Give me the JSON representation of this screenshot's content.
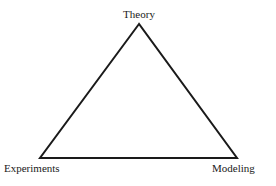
{
  "diagram": {
    "type": "triangle",
    "nodes": [
      {
        "id": "theory",
        "label": "Theory",
        "position": "top"
      },
      {
        "id": "experiments",
        "label": "Experiments",
        "position": "bottom-left"
      },
      {
        "id": "modeling",
        "label": "Modeling",
        "position": "bottom-right"
      }
    ],
    "edges": [
      {
        "from": "theory",
        "to": "experiments"
      },
      {
        "from": "theory",
        "to": "modeling"
      },
      {
        "from": "experiments",
        "to": "modeling"
      }
    ],
    "line_color": "#1a1a1a"
  }
}
